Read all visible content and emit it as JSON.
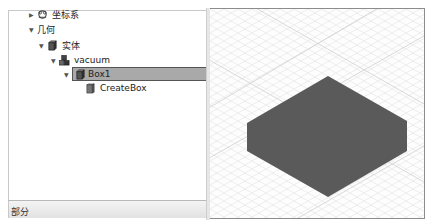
{
  "tree": {
    "items": [
      {
        "label": "坐标系",
        "icon": "coordinate-system-icon",
        "expanded": false,
        "level": 0
      },
      {
        "label": "几何",
        "icon": null,
        "expanded": true,
        "level": 0
      },
      {
        "label": "实体",
        "icon": "solid-icon",
        "expanded": true,
        "level": 1
      },
      {
        "label": "vacuum",
        "icon": "group-icon",
        "expanded": true,
        "level": 2
      },
      {
        "label": "Box1",
        "icon": "box-icon",
        "expanded": true,
        "level": 3,
        "selected": true
      },
      {
        "label": "CreateBox",
        "icon": "create-box-icon",
        "expanded": null,
        "level": 4
      }
    ]
  },
  "bottom_bar": {
    "label": "部分"
  },
  "viewport": {
    "shape": "box",
    "fill_color": "#5a5a5a",
    "grid_color": "#dcdcdc"
  }
}
